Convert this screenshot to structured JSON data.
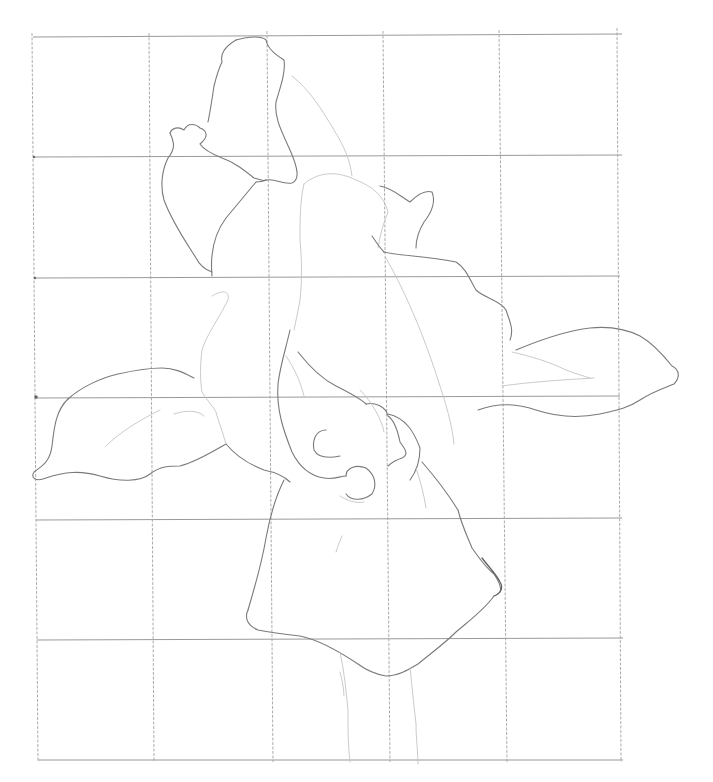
{
  "image": {
    "subject": "pencil sketch of a flower drawn over a reference grid",
    "background_color": "#ffffff",
    "line_color": "#7a7a7a",
    "grid_color": "#8d8d8d"
  },
  "grid": {
    "columns": 5,
    "rows": 6,
    "x_lines": [
      35,
      152,
      270,
      388,
      505,
      622
    ],
    "y_lines": [
      36,
      157,
      278,
      397,
      520,
      640,
      760
    ]
  }
}
